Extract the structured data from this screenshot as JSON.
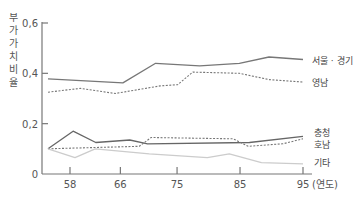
{
  "chart_data": {
    "type": "line",
    "title": "",
    "ylabel": "부가가치비율",
    "xlabel": "(연도)",
    "ylim": [
      0,
      0.6
    ],
    "xlim": [
      54,
      97
    ],
    "y_ticks": [
      "0",
      "0.2",
      "0.4",
      "0.6"
    ],
    "y_tick_values": [
      0,
      0.2,
      0.4,
      0.6
    ],
    "x_ticks": [
      "58",
      "66",
      "75",
      "85",
      "95"
    ],
    "x_tick_values": [
      58,
      66,
      75,
      85,
      95
    ],
    "grid": false,
    "legend_position": "inline-right",
    "series": [
      {
        "name": "서울 · 경기",
        "style": "solid",
        "color": "#777777",
        "x": [
          54.5,
          66.4,
          71.6,
          78.6,
          84.9,
          89.6,
          95
        ],
        "values": [
          0.378,
          0.362,
          0.44,
          0.43,
          0.44,
          0.465,
          0.455
        ]
      },
      {
        "name": "영남",
        "style": "dotted",
        "color": "#777777",
        "x": [
          54.5,
          59.6,
          65.2,
          72.3,
          75.1,
          77.5,
          84.9,
          89.6,
          95
        ],
        "values": [
          0.325,
          0.34,
          0.32,
          0.35,
          0.355,
          0.405,
          0.4,
          0.375,
          0.365
        ]
      },
      {
        "name": "충청",
        "style": "solid",
        "color": "#666666",
        "x": [
          54.5,
          58.5,
          62.1,
          67.5,
          70.3,
          86.5,
          95
        ],
        "values": [
          0.1,
          0.17,
          0.125,
          0.135,
          0.12,
          0.125,
          0.15
        ]
      },
      {
        "name": "호남",
        "style": "dotted",
        "color": "#777777",
        "x": [
          54.5,
          69.0,
          70.9,
          83.9,
          86.3,
          91.8,
          95
        ],
        "values": [
          0.1,
          0.11,
          0.145,
          0.14,
          0.11,
          0.12,
          0.14
        ]
      },
      {
        "name": "기타",
        "style": "solid",
        "color": "#cccccc",
        "x": [
          54.5,
          58.8,
          62.0,
          70.6,
          79.8,
          83.3,
          88.4,
          95
        ],
        "values": [
          0.1,
          0.065,
          0.1,
          0.08,
          0.065,
          0.08,
          0.045,
          0.04
        ]
      }
    ],
    "annotations": []
  },
  "labels": {
    "y_axis_chars": [
      "부",
      "가",
      "가",
      "치",
      "비",
      "율"
    ],
    "x_unit": "(연도)",
    "series_labels": [
      "서울 · 경기",
      "영남",
      "충청",
      "호남",
      "기타"
    ]
  }
}
